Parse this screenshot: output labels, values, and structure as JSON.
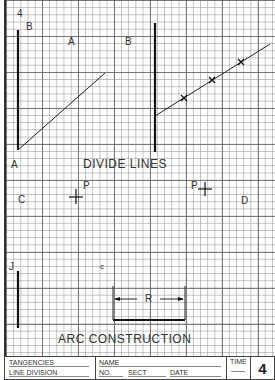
{
  "sheet": {
    "number": "4",
    "grid": {
      "minor_px": 7.2,
      "major_px": 36,
      "line_color": "#5a5a5a"
    }
  },
  "divide_lines": {
    "title": "DIVIDE LINES",
    "left": {
      "top_label": "B",
      "bottom_label": "A",
      "line_label": "A"
    },
    "right": {
      "label": "B",
      "tick_count": 3
    }
  },
  "tangency_points": {
    "left": {
      "region_label": "C",
      "point_label": "P"
    },
    "right": {
      "region_label": "D",
      "point_label": "P"
    }
  },
  "arc_construction": {
    "title": "ARC CONSTRUCTION",
    "line_label": "J",
    "center_label": "c",
    "radius_label": "R"
  },
  "title_block": {
    "subject_1": "TANGENCIES",
    "subject_2": "LINE DIVISION",
    "name_label": "NAME",
    "no_label": "NO.",
    "sect_label": "SECT",
    "date_label": "DATE",
    "time_label": "TIME",
    "sheet_number": "4"
  }
}
